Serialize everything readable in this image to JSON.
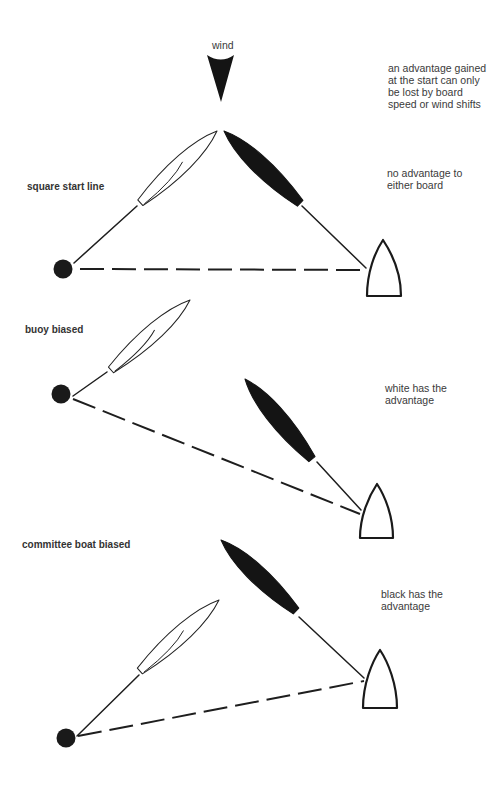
{
  "wind": {
    "label": "wind"
  },
  "general_note": {
    "lines": [
      "an advantage gained",
      "at the start can only",
      "be lost by board",
      "speed or wind shifts"
    ]
  },
  "scenarios": [
    {
      "label": "square start line",
      "note": [
        "no advantage to",
        "either board"
      ],
      "elements": [
        "white board",
        "black board",
        "buoy",
        "committee boat",
        "start line"
      ]
    },
    {
      "label": "buoy biased",
      "note": [
        "white has the",
        "advantage"
      ],
      "elements": [
        "white board",
        "black board",
        "buoy",
        "committee boat",
        "start line"
      ]
    },
    {
      "label": "committee boat biased",
      "note": [
        "black has the",
        "advantage"
      ],
      "elements": [
        "white board",
        "black board",
        "buoy",
        "committee boat",
        "start line"
      ]
    }
  ],
  "colors": {
    "background": "#ffffff",
    "ink": "#141414",
    "text": "#3a3a3a"
  }
}
